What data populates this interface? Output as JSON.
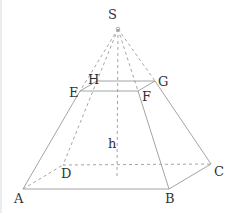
{
  "diagram": {
    "colors": {
      "line": "#9a9a9a",
      "text": "#333333",
      "background": "#ffffff"
    },
    "labels": {
      "S": "S",
      "H": "H",
      "G": "G",
      "E": "E",
      "F": "F",
      "A": "A",
      "B": "B",
      "C": "C",
      "D": "D",
      "h": "h"
    },
    "points": {
      "S": [
        118,
        29
      ],
      "E": [
        80,
        91
      ],
      "F": [
        138,
        91
      ],
      "G": [
        155,
        81
      ],
      "H": [
        97,
        81
      ],
      "A": [
        23,
        189
      ],
      "B": [
        169,
        189
      ],
      "C": [
        211,
        164
      ],
      "D": [
        63,
        165
      ]
    }
  }
}
